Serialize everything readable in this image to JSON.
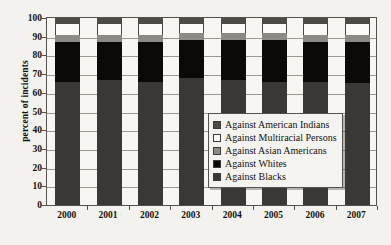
{
  "chart_data": {
    "type": "bar",
    "stacked": true,
    "title": "",
    "xlabel": "",
    "ylabel": "percent of incidents",
    "ylim": [
      0,
      100
    ],
    "ytick_step": 10,
    "yticks": [
      0,
      10,
      20,
      30,
      40,
      50,
      60,
      70,
      80,
      90,
      100
    ],
    "grid": true,
    "legend_position": "inside-right-middle",
    "categories": [
      "2000",
      "2001",
      "2002",
      "2003",
      "2004",
      "2005",
      "2006",
      "2007"
    ],
    "series": [
      {
        "name": "Against Blacks",
        "color": "#3a3834",
        "values": [
          66,
          67,
          66,
          68,
          67,
          66,
          66,
          65
        ]
      },
      {
        "name": "Against Whites",
        "color": "#0a0907",
        "values": [
          21,
          20,
          21,
          20,
          21,
          22,
          21,
          22
        ]
      },
      {
        "name": "Against Asian Americans",
        "color": "#8d8a85",
        "values": [
          4,
          4,
          4,
          4,
          4,
          4,
          4,
          4
        ]
      },
      {
        "name": "Against Multiracial Persons",
        "color": "#fdfcf9",
        "values": [
          6,
          6,
          6,
          5,
          5,
          5,
          6,
          6
        ]
      },
      {
        "name": "Against American Indians",
        "color": "#4e4b46",
        "values": [
          3,
          3,
          3,
          3,
          3,
          3,
          3,
          3
        ]
      }
    ],
    "stack_order_bottom_to_top": [
      "Against Blacks",
      "Against Whites",
      "Against Asian Americans",
      "Against Multiracial Persons",
      "Against American Indians"
    ]
  },
  "legend": {
    "items": [
      {
        "label": "Against American Indians",
        "swatch": "sw-indians"
      },
      {
        "label": "Against Multiracial Persons",
        "swatch": "sw-multi"
      },
      {
        "label": "Against Asian Americans",
        "swatch": "sw-asian"
      },
      {
        "label": "Against Whites",
        "swatch": "sw-whites"
      },
      {
        "label": "Against Blacks",
        "swatch": "sw-blacks"
      }
    ]
  },
  "colors": {
    "background": "#f3f2ee",
    "plot_background": "#f7f6f2",
    "axis": "#55524d",
    "grid": "#9b9790",
    "text": "#15120f"
  }
}
